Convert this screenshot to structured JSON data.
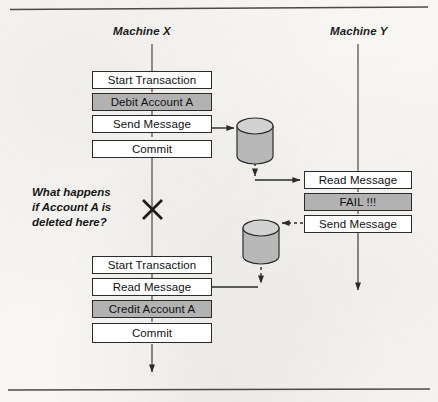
{
  "figure": {
    "type": "sequence-flow-diagram",
    "lanes": [
      {
        "id": "machine-x",
        "label": "Machine X"
      },
      {
        "id": "machine-y",
        "label": "Machine Y"
      }
    ],
    "note": {
      "lines": [
        "What happens",
        "if Account A is",
        "deleted here?"
      ],
      "marker": "x-cross"
    },
    "machine_x_upper_steps": [
      {
        "label": "Start Transaction",
        "shaded": false
      },
      {
        "label": "Debit Account A",
        "shaded": true
      },
      {
        "label": "Send Message",
        "shaded": false
      },
      {
        "label": "Commit",
        "shaded": false
      }
    ],
    "machine_x_lower_steps": [
      {
        "label": "Start Transaction",
        "shaded": false
      },
      {
        "label": "Read Message",
        "shaded": false
      },
      {
        "label": "Credit Account A",
        "shaded": true
      },
      {
        "label": "Commit",
        "shaded": false
      }
    ],
    "machine_y_steps": [
      {
        "label": "Read Message",
        "shaded": false
      },
      {
        "label": "FAIL !!!",
        "shaded": true
      },
      {
        "label": "Send Message",
        "shaded": false
      }
    ],
    "queues": [
      {
        "id": "queue-top",
        "label": ""
      },
      {
        "id": "queue-bottom",
        "label": ""
      }
    ],
    "colors": {
      "shaded_fill": "#b2b2b2",
      "node_fill": "#ffffff",
      "stroke": "#2b2b2b",
      "page": "#f7f6f3"
    }
  }
}
